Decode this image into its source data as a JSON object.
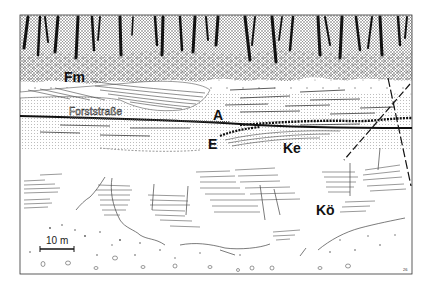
{
  "figure": {
    "type": "geological cross-section sketch",
    "frame": {
      "x": 20,
      "y": 15,
      "width": 392,
      "height": 259
    },
    "colors": {
      "ink": "#111111",
      "background": "#ffffff",
      "stipple": "#555555"
    }
  },
  "labels": {
    "fm": "Fm",
    "road": "Forststraße",
    "a": "A",
    "e": "E",
    "ke": "Ke",
    "ko": "Kö",
    "scale": "10 m",
    "figure_number": "26"
  },
  "units": [
    {
      "code": "Fm",
      "description": "upper unit below forest, with cross-bedded lens"
    },
    {
      "code": "A",
      "description": "horizon along the forest road"
    },
    {
      "code": "E",
      "description": "lower dotted-contact horizon"
    },
    {
      "code": "Ke",
      "description": "wedge below E"
    },
    {
      "code": "Kö",
      "description": "lower bedded unit with pebbles"
    }
  ],
  "scale_bar": {
    "label": "10 m",
    "length_px": 34
  }
}
